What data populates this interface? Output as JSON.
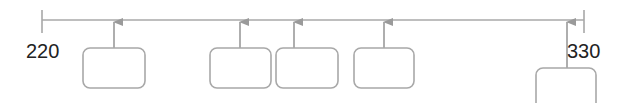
{
  "timeline": {
    "start_label": "220",
    "end_label": "330",
    "line_color": "#a8a8a8",
    "box_color": "#a8a8a8"
  },
  "events": [
    {
      "id": 1,
      "label": ""
    },
    {
      "id": 2,
      "label": ""
    },
    {
      "id": 3,
      "label": ""
    },
    {
      "id": 4,
      "label": ""
    },
    {
      "id": 5,
      "label": ""
    }
  ]
}
